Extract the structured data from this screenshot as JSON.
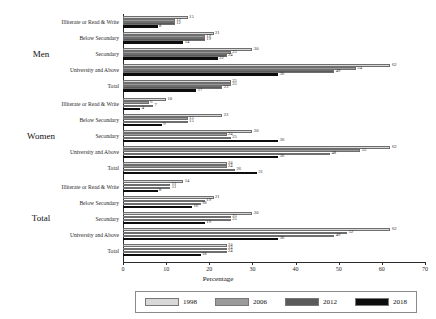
{
  "chart_data": {
    "type": "bar",
    "orientation": "horizontal",
    "title": "",
    "xlabel": "Percentage",
    "ylabel": "",
    "xlim": [
      0,
      70
    ],
    "xticks": [
      0,
      10,
      20,
      30,
      40,
      50,
      60,
      70
    ],
    "grid": false,
    "legend_position": "bottom",
    "series": [
      {
        "name": "1998",
        "color": "#d8d8d8"
      },
      {
        "name": "2006",
        "color": "#9a9a9a"
      },
      {
        "name": "2012",
        "color": "#5a5a5a"
      },
      {
        "name": "2018",
        "color": "#0d0d0d"
      }
    ],
    "groups": [
      {
        "name": "Men",
        "categories": [
          {
            "label": "Illiterate or Read & Write",
            "values": [
              15,
              12,
              12,
              8
            ]
          },
          {
            "label": "Below Secondary",
            "values": [
              21,
              19,
              19,
              14
            ]
          },
          {
            "label": "Secondary",
            "values": [
              30,
              25,
              24,
              22
            ]
          },
          {
            "label": "University and Above",
            "values": [
              62,
              54,
              49,
              36
            ]
          },
          {
            "label": "Total",
            "values": [
              25,
              25,
              23,
              17
            ]
          }
        ]
      },
      {
        "name": "Women",
        "categories": [
          {
            "label": "Illiterate or Read & Write",
            "values": [
              10,
              6,
              7,
              4
            ]
          },
          {
            "label": "Below Secondary",
            "values": [
              23,
              15,
              15,
              9
            ]
          },
          {
            "label": "Secondary",
            "values": [
              30,
              24,
              25,
              36
            ]
          },
          {
            "label": "University and Above",
            "values": [
              62,
              55,
              48,
              36
            ]
          },
          {
            "label": "Total",
            "values": [
              24,
              24,
              26,
              31
            ]
          }
        ]
      },
      {
        "name": "Total",
        "categories": [
          {
            "label": "Illiterate or Read & Write",
            "values": [
              14,
              11,
              11,
              8
            ]
          },
          {
            "label": "Below Secondary",
            "values": [
              21,
              19,
              18,
              16
            ]
          },
          {
            "label": "Secondary",
            "values": [
              30,
              25,
              25,
              19
            ]
          },
          {
            "label": "University and Above",
            "values": [
              62,
              52,
              49,
              36
            ]
          },
          {
            "label": "Total",
            "values": [
              24,
              24,
              24,
              18
            ]
          }
        ]
      }
    ]
  }
}
